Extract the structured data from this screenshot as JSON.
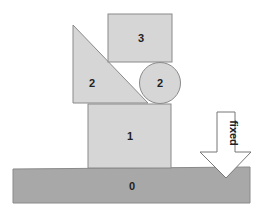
{
  "diagram": {
    "type": "block-stack",
    "colors": {
      "block_fill": "#d6d6d6",
      "block_stroke": "#8a8a8a",
      "ground_fill": "#a8a8a8",
      "arrow_fill": "#ffffff",
      "arrow_stroke": "#777777",
      "label": "#222222"
    },
    "shapes": {
      "ground": {
        "label": "0"
      },
      "box1": {
        "label": "1"
      },
      "triangle": {
        "label": "2"
      },
      "circle": {
        "label": "2"
      },
      "box3": {
        "label": "3"
      }
    },
    "arrow": {
      "label": "fixed",
      "direction": "down"
    }
  }
}
